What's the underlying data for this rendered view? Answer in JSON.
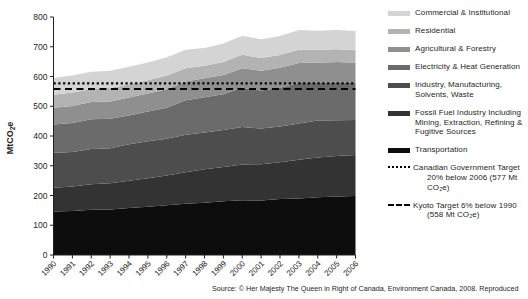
{
  "chart_data": {
    "type": "area",
    "title": "",
    "xlabel": "",
    "ylabel": "MtCO2e",
    "ylabel_display": "MtCO₂e",
    "ylim": [
      0,
      800
    ],
    "ytick_step": 100,
    "yticks": [
      0,
      100,
      200,
      300,
      400,
      500,
      600,
      700,
      800
    ],
    "grid": false,
    "stacked": true,
    "legend_position": "right",
    "categories": [
      1990,
      1991,
      1992,
      1993,
      1994,
      1995,
      1996,
      1997,
      1998,
      1999,
      2000,
      2001,
      2002,
      2003,
      2004,
      2005,
      2006
    ],
    "x_tick_labels": [
      "1990",
      "1991",
      "1992",
      "1993",
      "1994",
      "1995",
      "1996",
      "1997",
      "1998",
      "1999",
      "2000",
      "2001",
      "2002",
      "2003",
      "2004",
      "2005",
      "2006"
    ],
    "series": [
      {
        "name": "Transportation",
        "color": "#0d0d0d",
        "values": [
          146,
          148,
          152,
          153,
          158,
          162,
          167,
          172,
          176,
          181,
          184,
          183,
          188,
          190,
          194,
          197,
          198
        ]
      },
      {
        "name": "Fossil Fuel Industry Including Mining, Extraction, Refining & Fugitive Sources",
        "color": "#333333",
        "values": [
          80,
          82,
          86,
          88,
          92,
          96,
          100,
          106,
          112,
          115,
          120,
          122,
          124,
          130,
          134,
          136,
          138
        ]
      },
      {
        "name": "Industry, Manufacturing, Solvents, Waste",
        "color": "#4d4d4d",
        "values": [
          118,
          116,
          118,
          118,
          122,
          124,
          124,
          126,
          124,
          124,
          126,
          120,
          120,
          122,
          124,
          120,
          118
        ]
      },
      {
        "name": "Electricity & Heat Generation",
        "color": "#6b6b6b",
        "values": [
          95,
          98,
          100,
          99,
          97,
          100,
          104,
          116,
          118,
          120,
          132,
          128,
          130,
          136,
          126,
          128,
          124
        ]
      },
      {
        "name": "Agricultural & Forestry",
        "color": "#8f8f8f",
        "values": [
          56,
          57,
          58,
          58,
          60,
          61,
          62,
          63,
          64,
          65,
          66,
          66,
          67,
          67,
          68,
          68,
          68
        ]
      },
      {
        "name": "Residential",
        "color": "#b3b3b3",
        "values": [
          44,
          45,
          44,
          45,
          45,
          44,
          46,
          45,
          42,
          44,
          45,
          43,
          43,
          45,
          44,
          43,
          42
        ]
      },
      {
        "name": "Commercial & Institutional",
        "color": "#d4d4d4",
        "values": [
          56,
          57,
          58,
          58,
          59,
          60,
          62,
          62,
          60,
          62,
          64,
          63,
          64,
          66,
          64,
          64,
          65
        ]
      }
    ],
    "reference_lines": [
      {
        "name": "Canadian Government Target",
        "label_line1": "Canadian Government Target",
        "label_line2": "20% below 2006 (577 Mt CO₂e)",
        "value": 577,
        "style": "dotted",
        "color": "#000000"
      },
      {
        "name": "Kyoto Target",
        "label_line1": "Kyoto Target 6% below 1990",
        "label_line2": "(558 Mt CO₂e)",
        "value": 558,
        "style": "dashed",
        "color": "#000000"
      }
    ],
    "annotations": []
  },
  "legend": {
    "items": [
      {
        "label": "Commercial & Institutional",
        "color": "#d4d4d4",
        "style": "solid"
      },
      {
        "label": "Residential",
        "color": "#b3b3b3",
        "style": "solid"
      },
      {
        "label": "Agricultural & Forestry",
        "color": "#8f8f8f",
        "style": "solid"
      },
      {
        "label": "Electricity & Heat Generation",
        "color": "#6b6b6b",
        "style": "solid"
      },
      {
        "label_line1": "Industry, Manufacturing,",
        "label_line2": "Solvents, Waste",
        "color": "#4d4d4d",
        "style": "solid"
      },
      {
        "label_line1": "Fossil Fuel Industry Including",
        "label_line2": "Mining, Extraction, Refining &",
        "label_line3": "Fugitive Sources",
        "color": "#333333",
        "style": "solid"
      },
      {
        "label": "Transportation",
        "color": "#0d0d0d",
        "style": "solid"
      },
      {
        "label_line1": "Canadian Government Target",
        "label_line2": "20% below 2006 (577 Mt CO₂e)",
        "color": "#000000",
        "style": "dotted"
      },
      {
        "label_line1": "Kyoto Target 6% below 1990",
        "label_line2": "(558 Mt CO₂e)",
        "color": "#000000",
        "style": "dashed"
      }
    ]
  },
  "footer": {
    "source": "Source: © Her Majesty The Queen in Right of Canada, Environment Canada, 2008. Reproduced"
  }
}
